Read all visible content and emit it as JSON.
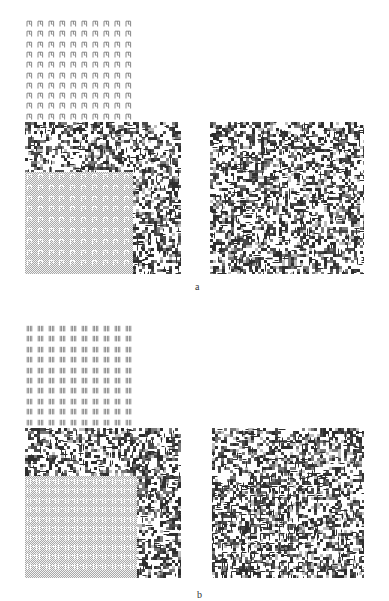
{
  "figure": {
    "colors": {
      "ink": "#4a4a4a",
      "dark": "#2e2e2e",
      "mid": "#7a7a7a",
      "light": "#bdbdbd",
      "paper": "#ffffff"
    },
    "subfigures": [
      {
        "id": "a",
        "caption": "a",
        "caption_pos": [
          195,
          281
        ],
        "texture_element": "pi-shaped-glyph",
        "glyph_grid": {
          "x": 26,
          "y": 13,
          "cols": 10,
          "rows": 10,
          "pitch_x": 11,
          "pitch_y": 10.3
        },
        "left_panel": {
          "x": 25,
          "y": 122,
          "w": 156,
          "h": 152,
          "seed": 11,
          "inner": {
            "x": 0,
            "y": 50,
            "w": 108,
            "h": 102,
            "tile": "pi"
          }
        },
        "right_panel": {
          "x": 210,
          "y": 122,
          "w": 154,
          "h": 152,
          "seed": 23,
          "inner": null
        }
      },
      {
        "id": "b",
        "caption": "b",
        "caption_pos": [
          197,
          589
        ],
        "texture_element": "double-bar-glyph",
        "glyph_grid": {
          "x": 26,
          "y": 318,
          "cols": 10,
          "rows": 10,
          "pitch_x": 11,
          "pitch_y": 10.4
        },
        "left_panel": {
          "x": 25,
          "y": 428,
          "w": 156,
          "h": 150,
          "seed": 37,
          "inner": {
            "x": 0,
            "y": 48,
            "w": 112,
            "h": 102,
            "tile": "bars"
          }
        },
        "right_panel": {
          "x": 212,
          "y": 428,
          "w": 152,
          "h": 150,
          "seed": 51,
          "inner": {
            "x": 0,
            "y": 48,
            "w": 112,
            "h": 102,
            "tile": "bars-embedded"
          }
        }
      }
    ]
  }
}
